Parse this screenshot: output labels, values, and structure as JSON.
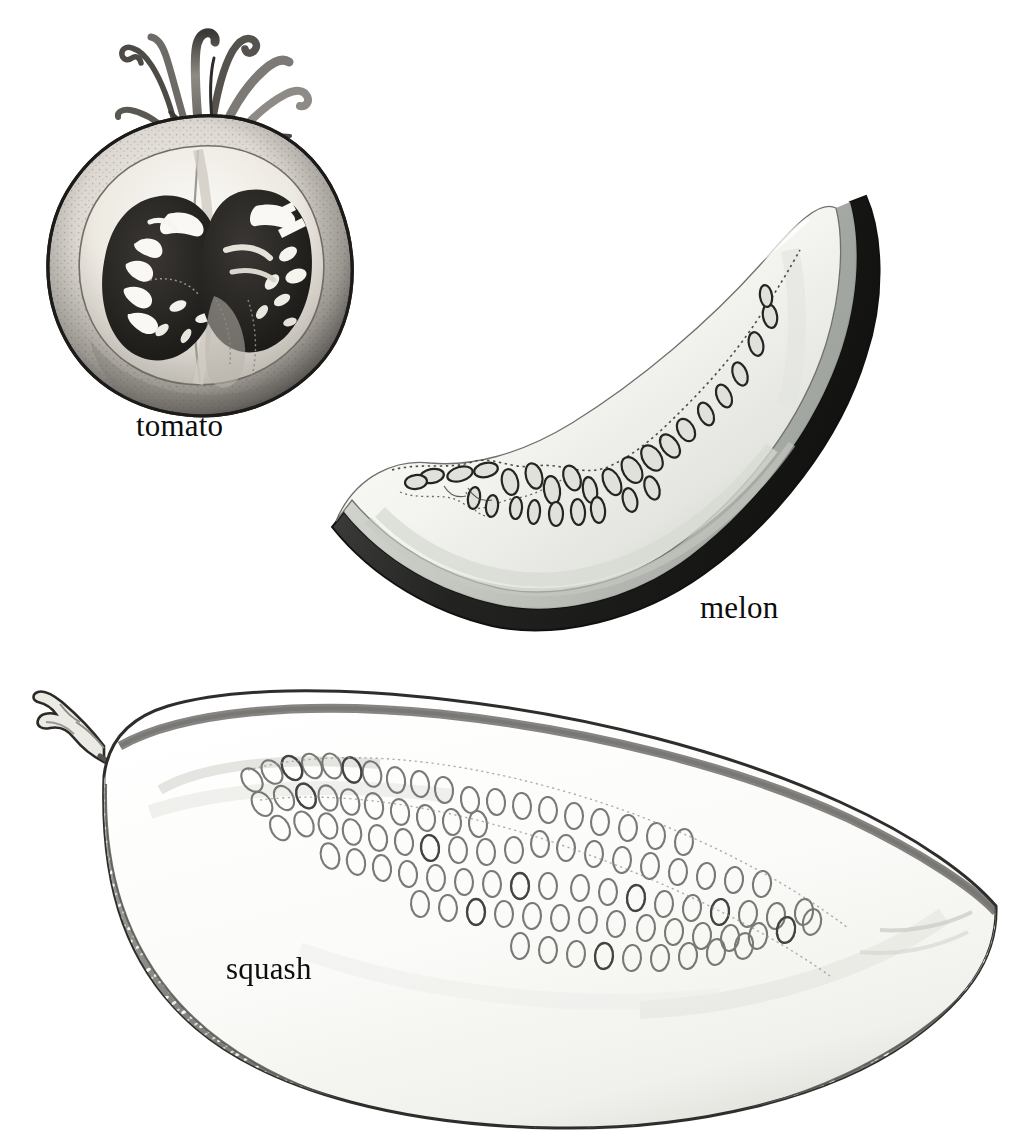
{
  "plate": {
    "title": "Fruit cross-sections botanical plate",
    "background_color": "#ffffff",
    "ink_color": "#1a1a1a",
    "width": 1026,
    "height": 1133,
    "medium": "graphite and ink wash illustration, grayscale",
    "subject": "cut fruit specimens showing internal seed arrangement"
  },
  "specimens": [
    {
      "id": "tomato",
      "label": "tomato",
      "cut": "vertical half section",
      "label_position": {
        "x": 136,
        "y": 410
      },
      "parts": {
        "calyx": "curling dried sepals at top",
        "skin": "dark stippled outer ring",
        "pericarp": "pale flesh wall",
        "locules": "two dark seed chambers",
        "seeds": "small white ovate seeds"
      },
      "colors": {
        "skin_dark": "#4a4a4a",
        "flesh_light": "#e8e6e0",
        "locule_dark": "#2b2b2b",
        "seed_white": "#fbfbf8",
        "calyx_gray": "#8a8a88"
      }
    },
    {
      "id": "melon",
      "label": "melon",
      "cut": "crescent wedge slice",
      "label_position": {
        "x": 700,
        "y": 592
      },
      "parts": {
        "rind": "dark outer band along convex curve",
        "mesocarp": "pale cream flesh",
        "seed_cavity": "dotted inner boundary",
        "seeds": "elongated outlined ovals in a row"
      },
      "colors": {
        "rind_dark": "#2a2a2a",
        "rind_inner": "#b9bcb6",
        "flesh": "#f2f2ee",
        "seed_outline": "#3a3a3a",
        "seed_fill": "#dcdcd6"
      }
    },
    {
      "id": "squash",
      "label": "squash",
      "cut": "longitudinal half section",
      "label_position": {
        "x": 226,
        "y": 953
      },
      "parts": {
        "stem": "woody cut stem at left tip",
        "rind": "mottled gray speckled lower wall",
        "flesh": "pale white mesocarp",
        "seed_mass": "dense field of faint outlined oval seeds",
        "seeds": "many pale ovoid seeds in overlapping rows"
      },
      "colors": {
        "rind_mottled": "#9d9d99",
        "rind_speckle": "#fdfdfb",
        "flesh": "#fafaf8",
        "outline": "#2f2f2f",
        "seed_outline": "#7e7e7c"
      }
    }
  ],
  "labels": {
    "tomato": "tomato",
    "melon": "melon",
    "squash": "squash"
  }
}
